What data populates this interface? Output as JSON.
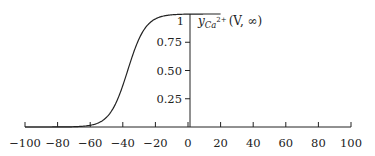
{
  "chart_data": {
    "type": "line",
    "title": "",
    "xlabel": "",
    "ylabel": "",
    "xlim": [
      -100,
      100
    ],
    "ylim": [
      0,
      1
    ],
    "grid": false,
    "x_ticks": [
      -100,
      -80,
      -60,
      -40,
      -20,
      0,
      20,
      40,
      60,
      80,
      100
    ],
    "x_tick_labels": [
      "−100",
      "−80",
      "−60",
      "−40",
      "−20",
      "0",
      "20",
      "40",
      "60",
      "80",
      "100"
    ],
    "y_ticks": [
      0.25,
      0.5,
      0.75,
      1
    ],
    "y_tick_labels": [
      "0.25",
      "0.50",
      "0.75",
      "1"
    ],
    "series": [
      {
        "name": "y_Ca2+(V, ∞)",
        "function": "sigmoid",
        "midpoint": -37,
        "slope": 5.5,
        "x_range": [
          -100,
          20
        ],
        "x": [
          -100,
          -80,
          -60,
          -50,
          -45,
          -40,
          -37,
          -35,
          -30,
          -25,
          -20,
          0,
          20
        ],
        "values": [
          0.0,
          0.0,
          0.015,
          0.09,
          0.19,
          0.37,
          0.5,
          0.59,
          0.78,
          0.9,
          0.96,
          1.0,
          1.0
        ]
      }
    ],
    "annotations": [
      {
        "text_main": "y",
        "text_sub": "Ca",
        "text_sup": "2+",
        "text_tail": "(V, ∞)"
      }
    ]
  }
}
